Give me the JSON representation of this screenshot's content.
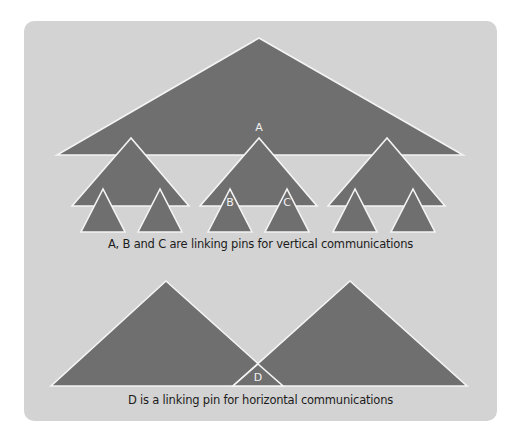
{
  "diagram": {
    "colors": {
      "page_background": "#ffffff",
      "panel_background": "#d3d3d3",
      "triangle_fill": "#6f6f6f",
      "triangle_outline": "#f4f4f4",
      "label_text": "#f2f2f2",
      "caption_text": "#1c1c1c"
    },
    "vertical_structure": {
      "top_group": {
        "points": "259,38 57,155 463,155"
      },
      "middle_groups": [
        {
          "points": "131,138 72,206 189,206"
        },
        {
          "points": "259,138 200,206 317,206"
        },
        {
          "points": "387,138 328,206 445,206"
        }
      ],
      "bottom_groups": [
        {
          "points": "103,189 81,232 125,232"
        },
        {
          "points": "160,189 138,232 182,232"
        },
        {
          "points": "230,189 208,232 252,232"
        },
        {
          "points": "287,189 265,232 309,232"
        },
        {
          "points": "355,189 333,232 377,232"
        },
        {
          "points": "413,189 391,232 435,232"
        }
      ],
      "pins": [
        {
          "label": "A",
          "x": 259,
          "y": 128
        },
        {
          "label": "B",
          "x": 230,
          "y": 203
        },
        {
          "label": "C",
          "x": 287,
          "y": 203
        }
      ],
      "caption": "A, B and C are linking pins for vertical communications"
    },
    "horizontal_structure": {
      "left_group": {
        "points": "166,281 51,386 283,386"
      },
      "right_group": {
        "points": "350,281 233,386 467,386"
      },
      "overlap": {
        "points": "258,364 233,386 283,386"
      },
      "pins": [
        {
          "label": "D",
          "x": 258,
          "y": 378
        }
      ],
      "caption": "D is a linking pin for horizontal communications"
    }
  }
}
